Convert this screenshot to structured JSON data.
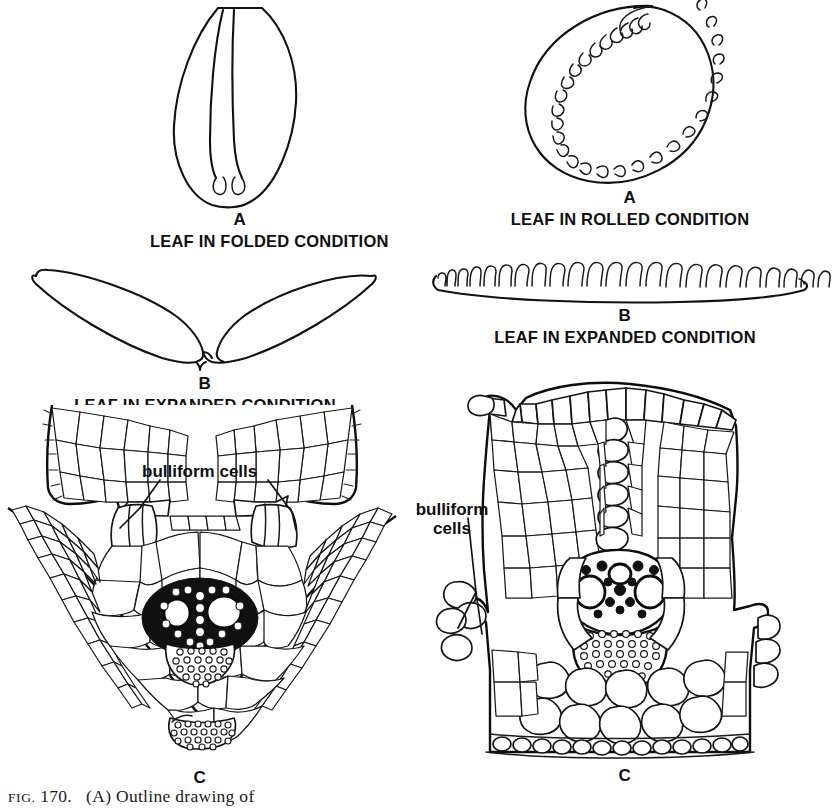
{
  "figure": {
    "caption_prefix": "FIG.",
    "caption_number": "170.",
    "caption_text": "(A) Outline drawing of"
  },
  "columns": [
    {
      "id": "folded",
      "panels": [
        {
          "letter": "A",
          "title": "LEAF IN FOLDED CONDITION",
          "description": "outline of a folded grass leaf seen in transverse section, narrow elliptical blade with a median cleft"
        },
        {
          "letter": "B",
          "title": "LEAF IN EXPANDED CONDITION",
          "description": "outline of the same leaf unfolded, shallow V shape with a small median notch"
        },
        {
          "letter": "C",
          "title": "",
          "description": "cellular transverse section of folded leaf showing bulliform cell groups, central vascular bundle with two large metaxylem vessels and abaxial sclerenchyma girder"
        }
      ],
      "annotations": [
        {
          "name": "bulliform-cells-label",
          "text": "bulliform cells",
          "lines": [
            "bulliform cells"
          ]
        }
      ]
    },
    {
      "id": "rolled",
      "panels": [
        {
          "letter": "A",
          "title": "LEAF IN ROLLED CONDITION",
          "description": "outline of an inrolled grass leaf in transverse section, spiral with ribbed inner surface"
        },
        {
          "letter": "B",
          "title": "LEAF IN EXPANDED CONDITION",
          "description": "outline of the same leaf unrolled, flat blade with numerous adaxial ribs and furrows"
        },
        {
          "letter": "C",
          "title": "",
          "description": "cellular transverse section of rolled leaf showing bulliform cells in a furrow and a large central vascular bundle"
        }
      ],
      "annotations": [
        {
          "name": "bulliform-cells-label",
          "text": "bulliform cells",
          "lines": [
            "bulliform",
            "cells"
          ]
        }
      ]
    }
  ],
  "colors": {
    "ink": "#111111",
    "paper": "#ffffff"
  }
}
